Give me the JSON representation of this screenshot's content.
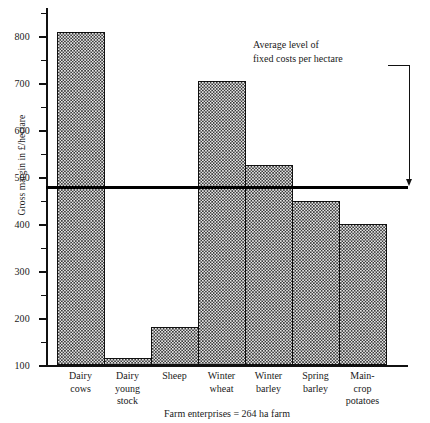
{
  "chart_data": {
    "type": "bar",
    "title": "",
    "xlabel": "Farm enterprises = 264 ha farm",
    "ylabel": "Gross margin in £/hectare",
    "categories": [
      "Dairy cows",
      "Dairy young stock",
      "Sheep",
      "Winter wheat",
      "Winter barley",
      "Spring barley",
      "Main-crop potatoes"
    ],
    "category_lines": [
      [
        "Dairy",
        "cows"
      ],
      [
        "Dairy",
        "young",
        "stock"
      ],
      [
        "Sheep"
      ],
      [
        "Winter",
        "wheat"
      ],
      [
        "Winter",
        "barley"
      ],
      [
        "Spring",
        "barley"
      ],
      [
        "Main-",
        "crop",
        "potatoes"
      ]
    ],
    "values": [
      810,
      115,
      180,
      705,
      525,
      450,
      400
    ],
    "ylim": [
      100,
      860
    ],
    "ybase": 100,
    "yticks": [
      100,
      200,
      300,
      400,
      500,
      600,
      700,
      800
    ],
    "ytick_labels": [
      "100",
      "200",
      "300",
      "400",
      "500",
      "600",
      "700",
      "800"
    ],
    "yminor_ticks": [
      150,
      250,
      350,
      450,
      550,
      650,
      750,
      850
    ],
    "grid": false,
    "legend": false,
    "reference_line": {
      "value": 478,
      "label_lines": [
        "Average level of",
        "fixed costs per hectare"
      ],
      "label_text": "Average level of fixed costs per hectare"
    },
    "series": [
      {
        "name": "Gross margin",
        "values": [
          810,
          115,
          180,
          705,
          525,
          450,
          400
        ]
      }
    ],
    "colors": {
      "bar_fill_dark": "#3a3a3a",
      "bar_fill_light": "#e8e8e8",
      "bar_border": "#111111",
      "axis": "#111111",
      "reference_line": "#000000",
      "text": "#1a1a1a"
    }
  }
}
